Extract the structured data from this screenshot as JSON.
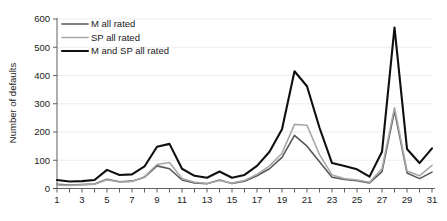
{
  "chart_data": {
    "type": "line",
    "title": "",
    "xlabel": "",
    "ylabel": "Number of defaults",
    "xlim": [
      1,
      31
    ],
    "ylim": [
      0,
      600
    ],
    "ytick_values": [
      0,
      100,
      200,
      300,
      400,
      500,
      600
    ],
    "ytick_labels": [
      "0",
      "100",
      "200",
      "300",
      "400",
      "500",
      "600"
    ],
    "xtick_values": [
      1,
      2,
      3,
      4,
      5,
      6,
      7,
      8,
      9,
      10,
      11,
      12,
      13,
      14,
      15,
      16,
      17,
      18,
      19,
      20,
      21,
      22,
      23,
      24,
      25,
      26,
      27,
      28,
      29,
      30,
      31
    ],
    "xtick_labels": [
      "1",
      "",
      "3",
      "",
      "5",
      "",
      "7",
      "",
      "9",
      "",
      "11",
      "",
      "13",
      "",
      "15",
      "",
      "17",
      "",
      "19",
      "",
      "21",
      "",
      "23",
      "",
      "25",
      "",
      "27",
      "",
      "29",
      "",
      "31"
    ],
    "grid": true,
    "grid_axis": "y",
    "legend_position": "top-left",
    "x": [
      1,
      2,
      3,
      4,
      5,
      6,
      7,
      8,
      9,
      10,
      11,
      12,
      13,
      14,
      15,
      16,
      17,
      18,
      19,
      20,
      21,
      22,
      23,
      24,
      25,
      26,
      27,
      28,
      29,
      30,
      31
    ],
    "series": [
      {
        "name": "M all rated",
        "color": "#575757",
        "width": 1.6,
        "values": [
          15,
          12,
          14,
          16,
          33,
          24,
          26,
          40,
          80,
          70,
          30,
          20,
          17,
          30,
          18,
          26,
          45,
          70,
          110,
          188,
          150,
          95,
          40,
          32,
          28,
          20,
          60,
          275,
          55,
          35,
          58
        ]
      },
      {
        "name": "SP all rated",
        "color": "#a8a8a8",
        "width": 1.6,
        "values": [
          12,
          11,
          13,
          15,
          31,
          23,
          25,
          42,
          85,
          92,
          35,
          22,
          18,
          28,
          19,
          28,
          50,
          80,
          125,
          227,
          224,
          120,
          48,
          35,
          30,
          22,
          70,
          286,
          62,
          45,
          82
        ]
      },
      {
        "name": "M and SP all rated",
        "color": "#101010",
        "width": 2.1,
        "values": [
          30,
          25,
          26,
          30,
          66,
          48,
          50,
          78,
          148,
          158,
          70,
          45,
          38,
          60,
          38,
          48,
          80,
          130,
          210,
          415,
          362,
          215,
          90,
          80,
          68,
          42,
          130,
          570,
          140,
          90,
          142
        ]
      }
    ]
  },
  "legend": {
    "entries": [
      {
        "label": "M all rated"
      },
      {
        "label": "SP all rated"
      },
      {
        "label": "M and SP all rated"
      }
    ]
  },
  "axes": {
    "y_title": "Number of defaults"
  }
}
